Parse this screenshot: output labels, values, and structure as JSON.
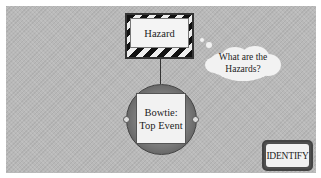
{
  "diagram": {
    "hazard": {
      "label": "Hazard"
    },
    "top_event": {
      "line1": "Bowtie:",
      "line2": "Top Event"
    },
    "thought_bubble": {
      "line1": "What are the",
      "line2": "Hazards?"
    },
    "identify_button": {
      "label": "IDENTIFY"
    }
  },
  "colors": {
    "background_panel": "#b9b9b9",
    "stripe_dark": "#111111",
    "stripe_light": "#eeeeee",
    "circle_ring": "#7a7a7a",
    "box_fill": "#f2f2f2"
  }
}
